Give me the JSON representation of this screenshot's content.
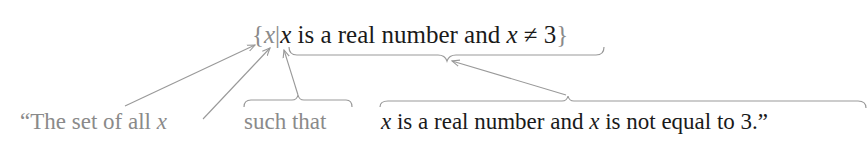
{
  "formula": {
    "open_brace": "{",
    "variable": "x",
    "bar": "|",
    "cond_var": "x",
    "cond_text_1": " is a real number and ",
    "cond_var_2": "x",
    "cond_text_2": " ≠ 3",
    "close_brace": "}"
  },
  "labels": {
    "set_of_all": "“The set of all ",
    "set_of_all_var": "x",
    "such_that": "such that",
    "condition_var": "x",
    "condition_text": " is a real number and ",
    "condition_var_2": "x",
    "condition_text_2": " is not equal to 3.”"
  },
  "colors": {
    "annotation_gray": "#8a8a8a",
    "text_dark": "#1a1a1a",
    "line_gray": "#999999"
  }
}
